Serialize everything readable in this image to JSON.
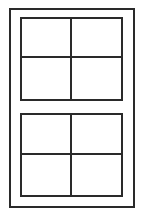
{
  "diagram": {
    "type": "window-elevation",
    "stroke_color": "#2a2a2a",
    "background_color": "#ffffff",
    "frame": {
      "x": 9,
      "y": 8,
      "width": 126,
      "height": 200
    },
    "sashes": [
      {
        "name": "upper",
        "x": 20,
        "y": 17,
        "width": 103,
        "height": 84,
        "panes": 4
      },
      {
        "name": "lower",
        "x": 20,
        "y": 113,
        "width": 103,
        "height": 84,
        "panes": 4
      }
    ]
  }
}
